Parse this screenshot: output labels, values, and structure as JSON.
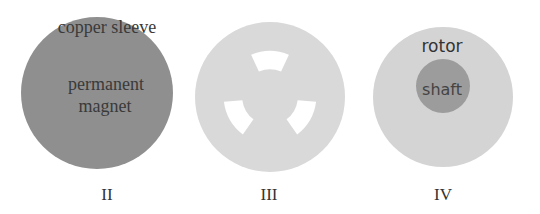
{
  "figure": {
    "panels": [
      {
        "id": "II",
        "caption": "II",
        "labels": {
          "outer": "copper sleeve",
          "inner_line1": "permanent",
          "inner_line2": "magnet"
        },
        "colors": {
          "fill": "#8f8f8f",
          "text": "#3a3a3a"
        }
      },
      {
        "id": "III",
        "caption": "III",
        "colors": {
          "fill": "#d9d9d9",
          "slot": "#ffffff"
        }
      },
      {
        "id": "IV",
        "caption": "IV",
        "labels": {
          "outer": "rotor",
          "inner": "shaft"
        },
        "colors": {
          "outer_fill": "#d4d4d4",
          "inner_fill": "#9c9c9c",
          "text": "#333333"
        }
      }
    ]
  }
}
